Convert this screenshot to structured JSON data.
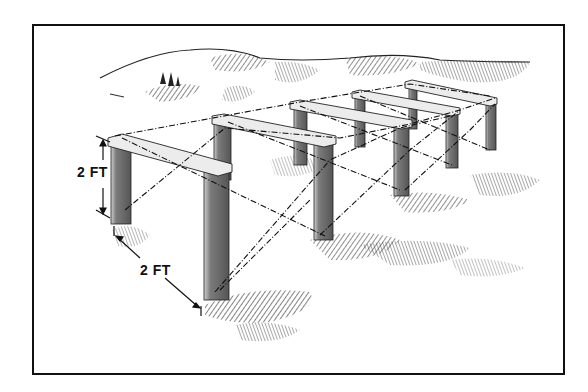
{
  "figure": {
    "dimensions": {
      "height_label": "2 FT",
      "spacing_label": "2 FT"
    },
    "frame_count": 5,
    "colors": {
      "ink": "#111111",
      "post_fill": "#8a8a8a",
      "post_shade": "#5a5a5a",
      "rail_fill": "#e8e8e8",
      "background": "#ffffff",
      "border": "#111111"
    }
  }
}
